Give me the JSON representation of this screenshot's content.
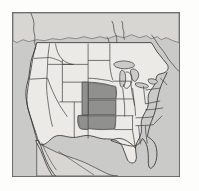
{
  "figure": {
    "type": "choropleth-map",
    "title": "",
    "region": "United States",
    "projection_note": "conterminous United States with southern Canada and northern Mexico",
    "border_color": "#6e6e6e",
    "background_color": "#fdfdfb"
  },
  "map": {
    "name": "united-states-map",
    "ocean_color": "#c9c9c7",
    "land_color": "#eceae6",
    "foreign_land_color": "#d8d6d2",
    "state_border_color": "#3a3a3a",
    "highlight_color": "#8e8e8c",
    "highlight_label": "",
    "legend": [],
    "highlighted_states": [
      "Nebraska",
      "Kansas",
      "Oklahoma",
      "Colorado (eastern)",
      "Texas (panhandle)"
    ],
    "visible_features": [
      "Pacific coast",
      "Baja California peninsula",
      "Great Lakes",
      "Florida peninsula",
      "Atlantic coast",
      "Gulf of Mexico",
      "Canada border",
      "Mexico border"
    ]
  }
}
